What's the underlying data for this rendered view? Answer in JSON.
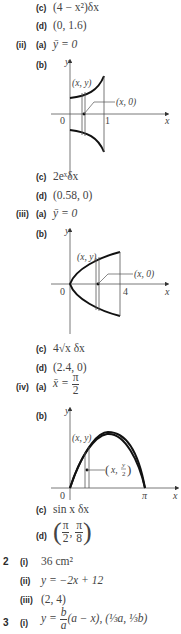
{
  "q1": {
    "i": {
      "c_label": "(c)",
      "c_value": "(4 − x²)δx",
      "d_label": "(d)",
      "d_value": "(0, 1.6)"
    },
    "ii": {
      "label": "(ii)",
      "a_label": "(a)",
      "a_value": "ȳ = 0",
      "b_label": "(b)",
      "graph": {
        "y_axis": "y",
        "x_axis": "x",
        "origin": "0",
        "tick": "1",
        "point_label": "(x, y)",
        "pointer_label": "(x, 0)"
      },
      "c_label": "(c)",
      "c_value": "2eˣδx",
      "d_label": "(d)",
      "d_value": "(0.58, 0)"
    },
    "iii": {
      "label": "(iii)",
      "a_label": "(a)",
      "a_value": "ȳ = 0",
      "b_label": "(b)",
      "graph": {
        "y_axis": "y",
        "x_axis": "x",
        "origin": "0",
        "tick": "4",
        "point_label": "(x, y)",
        "pointer_label": "(x, 0)"
      },
      "c_label": "(c)",
      "c_value": "4√x δx",
      "d_label": "(d)",
      "d_value": "(2.4, 0)"
    },
    "iv": {
      "label": "(iv)",
      "a_label": "(a)",
      "a_lhs": "x̄ =",
      "a_num": "π",
      "a_den": "2",
      "b_label": "(b)",
      "graph": {
        "y_axis": "y",
        "x_axis": "x",
        "origin": "0",
        "tick": "π",
        "point_label": "(x, y)",
        "pointer_label_x": "x,",
        "pointer_label_num": "y",
        "pointer_label_den": "2"
      },
      "c_label": "(c)",
      "c_value": "sin x δx",
      "d_label": "(d)",
      "d_num1": "π",
      "d_den1": "2",
      "d_num2": "π",
      "d_den2": "8"
    }
  },
  "q2": {
    "number": "2",
    "i_label": "(i)",
    "i_value": "36 cm²",
    "ii_label": "(ii)",
    "ii_value": "y = −2x + 12",
    "iii_label": "(iii)",
    "iii_value": "(2, 4)"
  },
  "q3": {
    "number": "3",
    "i_label": "(i)",
    "i_lhs": "y =",
    "i_num": "b",
    "i_den": "a",
    "i_rest": "(a − x), (⅓a, ⅓b)"
  }
}
